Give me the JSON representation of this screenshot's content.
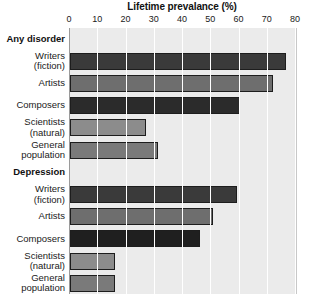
{
  "chart_data": {
    "type": "bar",
    "orientation": "horizontal",
    "title": "Lifetime prevalance (%)",
    "xlabel": "",
    "ylabel": "",
    "xlim": [
      0,
      80
    ],
    "xticks": [
      0,
      10,
      20,
      30,
      40,
      50,
      60,
      70,
      80
    ],
    "grid": true,
    "legend": "none",
    "groups": [
      {
        "name": "Any disorder",
        "categories": [
          "Writers\n(fiction)",
          "Artists",
          "Composers",
          "Scientists\n(natural)",
          "General\npopulation"
        ],
        "values": [
          76.5,
          72,
          60,
          27,
          31
        ],
        "colors": [
          "#3a3a3a",
          "#6e6e6e",
          "#2b2b2b",
          "#8c8c8c",
          "#7a7a7a"
        ]
      },
      {
        "name": "Depression",
        "categories": [
          "Writers\n(fiction)",
          "Artists",
          "Composers",
          "Scientists\n(natural)",
          "General\npopulation"
        ],
        "values": [
          59,
          50.5,
          46,
          16,
          16
        ],
        "colors": [
          "#3a3a3a",
          "#6e6e6e",
          "#1f1f1f",
          "#8c8c8c",
          "#7a7a7a"
        ]
      }
    ],
    "categories": [
      "Writers (fiction)",
      "Artists",
      "Composers",
      "Scientists (natural)",
      "General population"
    ],
    "series": [
      {
        "name": "Any disorder",
        "values": [
          76.5,
          72,
          60,
          27,
          31
        ]
      },
      {
        "name": "Depression",
        "values": [
          59,
          50.5,
          46,
          16,
          16
        ]
      }
    ]
  },
  "axis": {
    "tick_labels": [
      "0",
      "10",
      "20",
      "30",
      "40",
      "50",
      "60",
      "70",
      "80"
    ]
  },
  "rows": [
    {
      "kind": "group",
      "label": "Any disorder"
    },
    {
      "kind": "bar",
      "label": "Writers\n(fiction)",
      "value": 76.5,
      "color": "#3a3a3a"
    },
    {
      "kind": "bar",
      "label": "Artists",
      "value": 72,
      "color": "#6e6e6e"
    },
    {
      "kind": "bar",
      "label": "Composers",
      "value": 60,
      "color": "#2b2b2b"
    },
    {
      "kind": "bar",
      "label": "Scientists\n(natural)",
      "value": 27,
      "color": "#8c8c8c"
    },
    {
      "kind": "bar",
      "label": "General\npopulation",
      "value": 31,
      "color": "#7a7a7a"
    },
    {
      "kind": "group",
      "label": "Depression"
    },
    {
      "kind": "bar",
      "label": "Writers\n(fiction)",
      "value": 59,
      "color": "#3a3a3a"
    },
    {
      "kind": "bar",
      "label": "Artists",
      "value": 50.5,
      "color": "#6e6e6e"
    },
    {
      "kind": "bar",
      "label": "Composers",
      "value": 46,
      "color": "#1f1f1f"
    },
    {
      "kind": "bar",
      "label": "Scientists\n(natural)",
      "value": 16,
      "color": "#8c8c8c"
    },
    {
      "kind": "bar",
      "label": "General\npopulation",
      "value": 16,
      "color": "#7a7a7a"
    }
  ],
  "colors": {
    "plot_background": "#ebebeb",
    "gridline": "#ffffff",
    "bar_outline": "#1d1d1d",
    "text": "#1a1a1a"
  }
}
